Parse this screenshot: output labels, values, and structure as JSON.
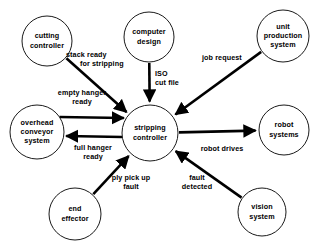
{
  "diagram": {
    "background_color": "#ffffff",
    "line_color": "#000000",
    "text_color": "#000000",
    "nodes": [
      {
        "id": "cutting-controller",
        "label_lines": [
          "cutting",
          "controller"
        ],
        "cx": 47,
        "cy": 41,
        "r": 25
      },
      {
        "id": "computer-design",
        "label_lines": [
          "computer",
          "design"
        ],
        "cx": 149,
        "cy": 37,
        "r": 25
      },
      {
        "id": "unit-production-system",
        "label_lines": [
          "unit",
          "production",
          "system"
        ],
        "cx": 283,
        "cy": 36,
        "r": 26
      },
      {
        "id": "overhead-conveyor-system",
        "label_lines": [
          "overhead",
          "conveyor",
          "system"
        ],
        "cx": 37,
        "cy": 132,
        "r": 27
      },
      {
        "id": "stripping-controller",
        "label_lines": [
          "stripping",
          "controller"
        ],
        "cx": 150,
        "cy": 133,
        "r": 28
      },
      {
        "id": "robot-systems",
        "label_lines": [
          "robot",
          "systems"
        ],
        "cx": 284,
        "cy": 130,
        "r": 25
      },
      {
        "id": "end-effector",
        "label_lines": [
          "end",
          "effector"
        ],
        "cx": 75,
        "cy": 214,
        "r": 26
      },
      {
        "id": "vision-system",
        "label_lines": [
          "vision",
          "system"
        ],
        "cx": 262,
        "cy": 212,
        "r": 24
      }
    ],
    "edges": [
      {
        "id": "stack-ready-for-stripping",
        "from": "cutting-controller",
        "to": "stripping-controller",
        "label_lines": [
          "stack ready",
          "for stripping"
        ],
        "label_x": 66,
        "label_y": 57,
        "label_anchor": "start",
        "label_indent": 14
      },
      {
        "id": "iso-cut-file",
        "from": "computer-design",
        "to": "stripping-controller",
        "label_lines": [
          "ISO",
          "cut file"
        ],
        "label_x": 155,
        "label_y": 76,
        "label_anchor": "start",
        "label_indent": 0
      },
      {
        "id": "job-request",
        "from": "unit-production-system",
        "to": "stripping-controller",
        "label_lines": [
          "job request"
        ],
        "label_x": 202,
        "label_y": 60,
        "label_anchor": "start",
        "label_indent": 0
      },
      {
        "id": "empty-hanger-ready",
        "from": "overhead-conveyor-system",
        "to": "stripping-controller",
        "label_lines": [
          "empty hanger",
          "ready"
        ],
        "label_x": 82,
        "label_y": 95,
        "label_anchor": "mid",
        "label_indent": 0
      },
      {
        "id": "full-hanger-ready",
        "from": "stripping-controller",
        "to": "overhead-conveyor-system",
        "label_lines": [
          "full hanger",
          "ready"
        ],
        "label_x": 93,
        "label_y": 150,
        "label_anchor": "mid",
        "label_indent": 0
      },
      {
        "id": "robot-drives",
        "from": "stripping-controller",
        "to": "robot-systems",
        "label_lines": [
          "robot drives"
        ],
        "label_x": 222,
        "label_y": 151,
        "label_anchor": "mid",
        "label_indent": 0
      },
      {
        "id": "ply-pick-up-fault",
        "from": "end-effector",
        "to": "stripping-controller",
        "label_lines": [
          "ply pick up",
          "fault"
        ],
        "label_x": 131,
        "label_y": 180,
        "label_anchor": "mid",
        "label_indent": 0
      },
      {
        "id": "fault-detected",
        "from": "vision-system",
        "to": "stripping-controller",
        "label_lines": [
          "fault",
          "detected"
        ],
        "label_x": 197,
        "label_y": 180,
        "label_anchor": "mid",
        "label_indent": 0
      }
    ]
  }
}
